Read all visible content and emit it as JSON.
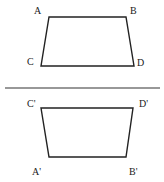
{
  "diagram": {
    "top_shape": {
      "points": {
        "A": [
          49,
          17
        ],
        "B": [
          126,
          17
        ],
        "D": [
          134,
          66
        ],
        "C": [
          41,
          66
        ]
      },
      "labels": {
        "A": {
          "text": "A",
          "x": 34,
          "y": 14
        },
        "B": {
          "text": "B",
          "x": 130,
          "y": 14
        },
        "C": {
          "text": "C",
          "x": 27,
          "y": 65
        },
        "D": {
          "text": "D",
          "x": 137,
          "y": 66
        }
      }
    },
    "divider": {
      "x1": 5,
      "y1": 88,
      "x2": 160,
      "y2": 88
    },
    "bottom_shape": {
      "points": {
        "C'": [
          41,
          108
        ],
        "D'": [
          133,
          108
        ],
        "B'": [
          126,
          157
        ],
        "A'": [
          49,
          157
        ]
      },
      "labels": {
        "Cp": {
          "text": "C'",
          "x": 27,
          "y": 107
        },
        "Dp": {
          "text": "D'",
          "x": 139,
          "y": 107
        },
        "Ap": {
          "text": "A'",
          "x": 32,
          "y": 175
        },
        "Bp": {
          "text": "B'",
          "x": 129,
          "y": 175
        }
      }
    }
  }
}
